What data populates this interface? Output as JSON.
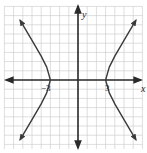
{
  "chart_data": {
    "type": "line",
    "title": "",
    "xlabel": "x",
    "ylabel": "y",
    "xlim": [
      -8,
      7
    ],
    "ylim": [
      -7.5,
      8
    ],
    "grid": true,
    "tick_labels": [
      {
        "value": -3,
        "text": "−3",
        "axis": "x"
      },
      {
        "value": 3,
        "text": "3",
        "axis": "x"
      }
    ],
    "series": [
      {
        "name": "left branch",
        "description": "hyperbola branch opening left, vertex (-3,0)",
        "points": [
          [
            -6.3,
            6.5
          ],
          [
            -5,
            4.3
          ],
          [
            -4,
            2.6
          ],
          [
            -3.4,
            1.4
          ],
          [
            -3,
            0
          ],
          [
            -3.4,
            -1.4
          ],
          [
            -4,
            -2.6
          ],
          [
            -5,
            -4.3
          ],
          [
            -6.3,
            -6.5
          ]
        ]
      },
      {
        "name": "right branch",
        "description": "hyperbola branch opening right, vertex (3,0)",
        "points": [
          [
            6.3,
            6.5
          ],
          [
            5,
            4.3
          ],
          [
            4,
            2.6
          ],
          [
            3.4,
            1.4
          ],
          [
            3,
            0
          ],
          [
            3.4,
            -1.4
          ],
          [
            4,
            -2.6
          ],
          [
            5,
            -4.3
          ],
          [
            6.3,
            -6.5
          ]
        ]
      }
    ],
    "equation_hint": "x^2/9 - y^2/b^2 = 1",
    "colors": {
      "grid": "#c8c8c8",
      "axes": "#2a2a2a",
      "curve": "#3a3a3a"
    }
  },
  "labels": {
    "x_axis": "x",
    "y_axis": "y",
    "tick_neg3": "−3",
    "tick_pos3": "3"
  }
}
